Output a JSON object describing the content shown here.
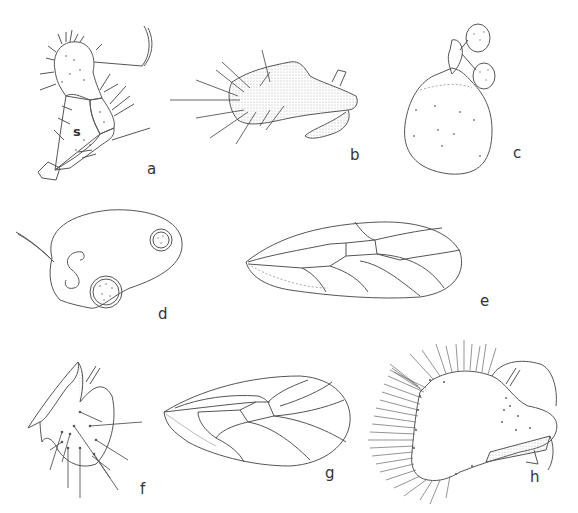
{
  "figure": {
    "stroke_color": "#555555",
    "stipple_color": "#b8b8b8",
    "background": "#ffffff"
  },
  "panels": [
    {
      "id": "a",
      "label": "a",
      "subject": "antenna/leg segment with setae",
      "annotation": "s"
    },
    {
      "id": "b",
      "label": "b",
      "subject": "paramere / genital process with setae, stippled"
    },
    {
      "id": "c",
      "label": "c",
      "subject": "spermatheca-like rounded body with two dotted discs"
    },
    {
      "id": "d",
      "label": "d",
      "subject": "oval sac with S-shaped duct and two dotted circular structures"
    },
    {
      "id": "e",
      "label": "e",
      "subject": "forewing venation"
    },
    {
      "id": "f",
      "label": "f",
      "subject": "terminalia lateral view with setae"
    },
    {
      "id": "g",
      "label": "g",
      "subject": "hindwing / forewing venation"
    },
    {
      "id": "h",
      "label": "h",
      "subject": "proctiger/subgenital plate with dense marginal setae"
    }
  ]
}
